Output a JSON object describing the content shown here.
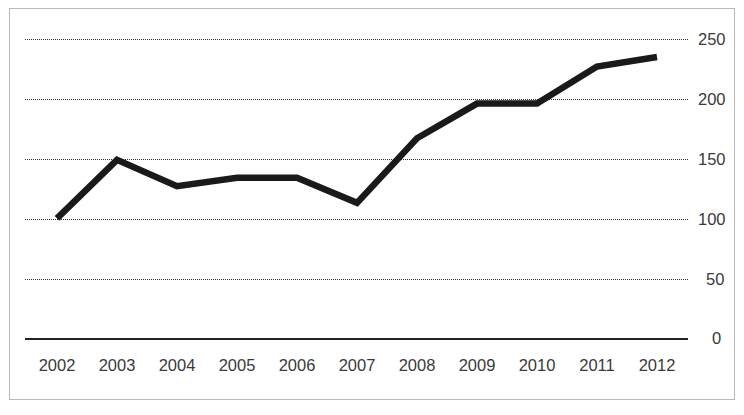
{
  "chart_data": {
    "type": "line",
    "title": "",
    "subtitle": "",
    "xlabel": "",
    "ylabel": "",
    "categories": [
      "2002",
      "2003",
      "2004",
      "2005",
      "2006",
      "2007",
      "2008",
      "2009",
      "2010",
      "2011",
      "2012"
    ],
    "x": [
      2002,
      2003,
      2004,
      2005,
      2006,
      2007,
      2008,
      2009,
      2010,
      2011,
      2012
    ],
    "values": [
      100,
      149,
      127,
      134,
      134,
      113,
      167,
      196,
      196,
      227,
      235
    ],
    "series": [
      {
        "name": "",
        "values": [
          100,
          149,
          127,
          134,
          134,
          113,
          167,
          196,
          196,
          227,
          235
        ]
      }
    ],
    "ylim": [
      0,
      250
    ],
    "yticks": [
      0,
      50,
      100,
      150,
      200,
      250
    ],
    "ytick_labels": [
      "0",
      "50",
      "100",
      "150",
      "200",
      "250"
    ],
    "grid": "horizontal-dotted",
    "legend": "none",
    "line_color": "#1a1a1a",
    "grid_color": "#2b2b2b",
    "axis_color": "#232323",
    "frame_color": "#b9b9b9",
    "background": "#ffffff"
  },
  "axis": {
    "y_labels": [
      "250",
      "200",
      "150",
      "100",
      "50",
      "0"
    ],
    "x_labels": [
      "2002",
      "2003",
      "2004",
      "2005",
      "2006",
      "2007",
      "2008",
      "2009",
      "2010",
      "2011",
      "2012"
    ]
  }
}
